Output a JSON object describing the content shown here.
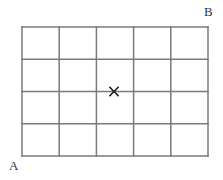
{
  "figure": {
    "kind": "grid-diagram",
    "background_color": "#ffffff",
    "width": 223,
    "height": 180
  },
  "grid": {
    "x": 22,
    "y": 27,
    "width": 186,
    "height": 129,
    "columns": 5,
    "rows": 4,
    "cell_width": 37.2,
    "cell_height": 32.25,
    "line_color": "#7a7a7a",
    "line_width": 1.5,
    "border_color": "#7a7a7a",
    "border_width": 1.5,
    "fill": "#ffffff",
    "vertical_line_x": [
      22,
      59.2,
      96.4,
      133.6,
      170.8,
      208
    ],
    "horizontal_line_y": [
      27,
      59.25,
      91.5,
      123.75,
      156
    ]
  },
  "labels": {
    "corner_a": {
      "text": "A",
      "position": "bottom-left-outside",
      "x": 9,
      "y": 159,
      "color": "#333333",
      "font_size": 13
    },
    "corner_b": {
      "text": "B",
      "position": "top-right-outside",
      "x": 204,
      "y": 5,
      "color": "#333333",
      "font_size": 13
    }
  },
  "marker": {
    "symbol": "×",
    "x": 114,
    "y": 91.5,
    "color": "#1a1a1a",
    "arm_length": 4.2,
    "stroke_width": 1.6,
    "grid_column": 3,
    "grid_row_line": 3,
    "description": "cross marker on third horizontal gridline"
  }
}
